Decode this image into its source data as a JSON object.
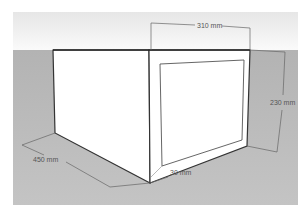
{
  "diagram": {
    "colors": {
      "sky": "#f2f2f2",
      "ground": "#b9b9b9",
      "box_face": "#ffffff",
      "edge": "#333333",
      "dimension_line": "#666666"
    },
    "dimensions": [
      {
        "id": "width",
        "label": "310 mm"
      },
      {
        "id": "height",
        "label": "230 mm"
      },
      {
        "id": "depth",
        "label": "450 mm"
      },
      {
        "id": "frame",
        "label": "30 mm"
      }
    ]
  }
}
